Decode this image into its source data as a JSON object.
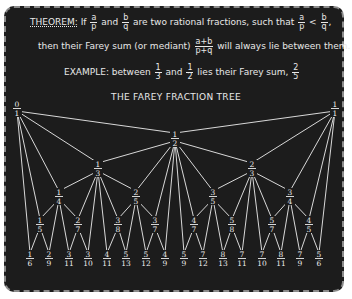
{
  "header": {
    "theorem_keyword": "THEOREM:",
    "line1_pre": "If",
    "frac_a_p": {
      "num": "a",
      "den": "p"
    },
    "line1_and": "and",
    "frac_b_q": {
      "num": "b",
      "den": "q"
    },
    "line1_mid": "are two rational fractions, such that",
    "ineq_lt": "<",
    "line1_end": ",",
    "line2_pre": "then their Farey sum (or mediant)",
    "frac_mediant": {
      "num": "a+b",
      "den": "p+q"
    },
    "line2_post": "will always lie between them.",
    "example_label": "EXAMPLE:",
    "example_between": "between",
    "ex_frac1": {
      "num": "1",
      "den": "3"
    },
    "example_and": "and",
    "ex_frac2": {
      "num": "1",
      "den": "2"
    },
    "example_post": "lies their Farey sum,",
    "ex_frac3": {
      "num": "2",
      "den": "5"
    }
  },
  "diagram": {
    "title": "THE FAREY FRACTION TREE",
    "colors": {
      "background": "#1c1c1c",
      "chalk": "#ededed",
      "frame": "#8a8a8a"
    },
    "nodes": [
      {
        "id": "0/1",
        "num": "0",
        "den": "1",
        "x": 17,
        "y": 108
      },
      {
        "id": "1/1",
        "num": "1",
        "den": "1",
        "x": 335,
        "y": 108
      },
      {
        "id": "1/2",
        "num": "1",
        "den": "2",
        "x": 175,
        "y": 138
      },
      {
        "id": "1/3",
        "num": "1",
        "den": "3",
        "x": 98,
        "y": 168
      },
      {
        "id": "2/3",
        "num": "2",
        "den": "3",
        "x": 252,
        "y": 168
      },
      {
        "id": "1/4",
        "num": "1",
        "den": "4",
        "x": 59,
        "y": 196
      },
      {
        "id": "2/5",
        "num": "2",
        "den": "5",
        "x": 136,
        "y": 196
      },
      {
        "id": "3/5",
        "num": "3",
        "den": "5",
        "x": 213,
        "y": 196
      },
      {
        "id": "3/4",
        "num": "3",
        "den": "4",
        "x": 290,
        "y": 196
      },
      {
        "id": "1/5",
        "num": "1",
        "den": "5",
        "x": 40,
        "y": 224
      },
      {
        "id": "2/7",
        "num": "2",
        "den": "7",
        "x": 78,
        "y": 224
      },
      {
        "id": "3/8",
        "num": "3",
        "den": "8",
        "x": 118,
        "y": 224
      },
      {
        "id": "3/7",
        "num": "3",
        "den": "7",
        "x": 155,
        "y": 224
      },
      {
        "id": "4/7",
        "num": "4",
        "den": "7",
        "x": 194,
        "y": 224
      },
      {
        "id": "5/8",
        "num": "5",
        "den": "8",
        "x": 232,
        "y": 224
      },
      {
        "id": "5/7",
        "num": "5",
        "den": "7",
        "x": 272,
        "y": 224
      },
      {
        "id": "4/5",
        "num": "4",
        "den": "5",
        "x": 309,
        "y": 224
      },
      {
        "id": "1/6",
        "num": "1",
        "den": "6",
        "x": 30,
        "y": 258
      },
      {
        "id": "2/9",
        "num": "2",
        "den": "9",
        "x": 49,
        "y": 258
      },
      {
        "id": "3/11",
        "num": "3",
        "den": "11",
        "x": 69,
        "y": 258
      },
      {
        "id": "3/10",
        "num": "3",
        "den": "10",
        "x": 88,
        "y": 258
      },
      {
        "id": "4/11",
        "num": "4",
        "den": "11",
        "x": 107,
        "y": 258
      },
      {
        "id": "5/13",
        "num": "5",
        "den": "13",
        "x": 126,
        "y": 258
      },
      {
        "id": "5/12",
        "num": "5",
        "den": "12",
        "x": 146,
        "y": 258
      },
      {
        "id": "4/9",
        "num": "4",
        "den": "9",
        "x": 165,
        "y": 258
      },
      {
        "id": "5/9",
        "num": "5",
        "den": "9",
        "x": 184,
        "y": 258
      },
      {
        "id": "7/12",
        "num": "7",
        "den": "12",
        "x": 203,
        "y": 258
      },
      {
        "id": "8/13",
        "num": "8",
        "den": "13",
        "x": 223,
        "y": 258
      },
      {
        "id": "7/11",
        "num": "7",
        "den": "11",
        "x": 242,
        "y": 258
      },
      {
        "id": "7/10",
        "num": "7",
        "den": "10",
        "x": 262,
        "y": 258
      },
      {
        "id": "8/11",
        "num": "8",
        "den": "11",
        "x": 281,
        "y": 258
      },
      {
        "id": "7/9",
        "num": "7",
        "den": "9",
        "x": 300,
        "y": 258
      },
      {
        "id": "5/6",
        "num": "5",
        "den": "6",
        "x": 319,
        "y": 258
      }
    ],
    "edges": [
      [
        "0/1",
        "1/2"
      ],
      [
        "1/1",
        "1/2"
      ],
      [
        "0/1",
        "1/3"
      ],
      [
        "1/2",
        "1/3"
      ],
      [
        "1/2",
        "2/3"
      ],
      [
        "1/1",
        "2/3"
      ],
      [
        "0/1",
        "1/4"
      ],
      [
        "1/3",
        "1/4"
      ],
      [
        "1/3",
        "2/5"
      ],
      [
        "1/2",
        "2/5"
      ],
      [
        "1/2",
        "3/5"
      ],
      [
        "2/3",
        "3/5"
      ],
      [
        "2/3",
        "3/4"
      ],
      [
        "1/1",
        "3/4"
      ],
      [
        "0/1",
        "1/5"
      ],
      [
        "1/4",
        "1/5"
      ],
      [
        "1/4",
        "2/7"
      ],
      [
        "1/3",
        "2/7"
      ],
      [
        "1/3",
        "3/8"
      ],
      [
        "2/5",
        "3/8"
      ],
      [
        "2/5",
        "3/7"
      ],
      [
        "1/2",
        "3/7"
      ],
      [
        "1/2",
        "4/7"
      ],
      [
        "3/5",
        "4/7"
      ],
      [
        "3/5",
        "5/8"
      ],
      [
        "2/3",
        "5/8"
      ],
      [
        "2/3",
        "5/7"
      ],
      [
        "3/4",
        "5/7"
      ],
      [
        "3/4",
        "4/5"
      ],
      [
        "1/1",
        "4/5"
      ],
      [
        "0/1",
        "1/6"
      ],
      [
        "1/5",
        "1/6"
      ],
      [
        "1/5",
        "2/9"
      ],
      [
        "1/4",
        "2/9"
      ],
      [
        "1/4",
        "3/11"
      ],
      [
        "2/7",
        "3/11"
      ],
      [
        "2/7",
        "3/10"
      ],
      [
        "1/3",
        "3/10"
      ],
      [
        "1/3",
        "4/11"
      ],
      [
        "3/8",
        "4/11"
      ],
      [
        "3/8",
        "5/13"
      ],
      [
        "2/5",
        "5/13"
      ],
      [
        "2/5",
        "5/12"
      ],
      [
        "3/7",
        "5/12"
      ],
      [
        "3/7",
        "4/9"
      ],
      [
        "1/2",
        "4/9"
      ],
      [
        "1/2",
        "5/9"
      ],
      [
        "4/7",
        "5/9"
      ],
      [
        "4/7",
        "7/12"
      ],
      [
        "3/5",
        "7/12"
      ],
      [
        "3/5",
        "8/13"
      ],
      [
        "5/8",
        "8/13"
      ],
      [
        "5/8",
        "7/11"
      ],
      [
        "2/3",
        "7/11"
      ],
      [
        "2/3",
        "7/10"
      ],
      [
        "5/7",
        "7/10"
      ],
      [
        "5/7",
        "8/11"
      ],
      [
        "3/4",
        "8/11"
      ],
      [
        "3/4",
        "7/9"
      ],
      [
        "4/5",
        "7/9"
      ],
      [
        "4/5",
        "5/6"
      ],
      [
        "1/1",
        "5/6"
      ]
    ]
  }
}
